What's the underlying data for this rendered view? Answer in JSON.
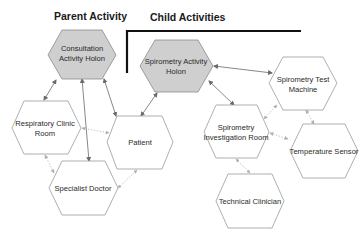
{
  "titles": {
    "parent": "Parent Activity",
    "child": "Child Activities"
  },
  "colors": {
    "holon_fill": "#cfcfcf",
    "node_fill": "#ffffff",
    "node_stroke": "#9a9a9a",
    "bracket": "#111111"
  },
  "nodes": [
    {
      "id": "consultation",
      "lines": [
        "Consultation",
        "Activity Holon"
      ],
      "type": "holon"
    },
    {
      "id": "spirometry_holon",
      "lines": [
        "Spirometry Activity",
        "Holon"
      ],
      "type": "holon"
    },
    {
      "id": "test_machine",
      "lines": [
        "Spirometry Test",
        "Machine"
      ],
      "type": "resource"
    },
    {
      "id": "clinic_room",
      "lines": [
        "Respiratory Clinic",
        "Room"
      ],
      "type": "resource"
    },
    {
      "id": "patient",
      "lines": [
        "Patient"
      ],
      "type": "resource"
    },
    {
      "id": "specialist",
      "lines": [
        "Specialist Doctor"
      ],
      "type": "resource"
    },
    {
      "id": "investigation_room",
      "lines": [
        "Spirometry",
        "Investigation Room"
      ],
      "type": "resource"
    },
    {
      "id": "temp_sensor",
      "lines": [
        "Temperature Sensor"
      ],
      "type": "resource"
    },
    {
      "id": "technician",
      "lines": [
        "Technical Clinician"
      ],
      "type": "resource"
    }
  ],
  "edges": [
    {
      "from": "consultation",
      "to": "clinic_room",
      "style": "solid"
    },
    {
      "from": "consultation",
      "to": "specialist",
      "style": "solid"
    },
    {
      "from": "consultation",
      "to": "patient",
      "style": "solid"
    },
    {
      "from": "spirometry_holon",
      "to": "patient",
      "style": "solid"
    },
    {
      "from": "spirometry_holon",
      "to": "test_machine",
      "style": "solid"
    },
    {
      "from": "spirometry_holon",
      "to": "investigation_room",
      "style": "solid"
    },
    {
      "from": "clinic_room",
      "to": "patient",
      "style": "dotted"
    },
    {
      "from": "clinic_room",
      "to": "specialist",
      "style": "dotted"
    },
    {
      "from": "specialist",
      "to": "patient",
      "style": "dotted"
    },
    {
      "from": "investigation_room",
      "to": "test_machine",
      "style": "dotted"
    },
    {
      "from": "investigation_room",
      "to": "temp_sensor",
      "style": "dotted"
    },
    {
      "from": "investigation_room",
      "to": "technician",
      "style": "dotted"
    },
    {
      "from": "test_machine",
      "to": "temp_sensor",
      "style": "dotted"
    }
  ]
}
